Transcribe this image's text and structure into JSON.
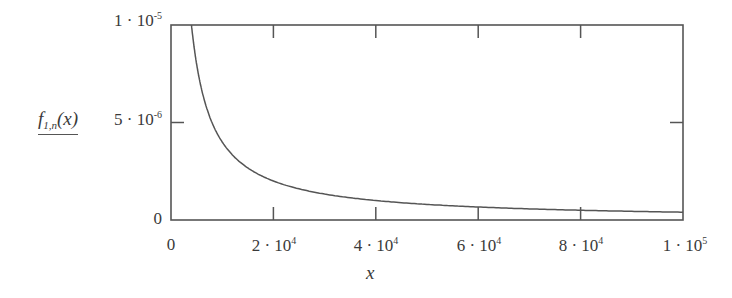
{
  "chart_data": {
    "type": "line",
    "title": "",
    "xlabel": "x",
    "ylabel": "f_{1,n}(x)",
    "xlim": [
      0,
      100000
    ],
    "ylim": [
      0,
      1e-05
    ],
    "grid": false,
    "legend": null,
    "x_ticks": [
      "0",
      "2·10^4",
      "4·10^4",
      "6·10^4",
      "8·10^4",
      "1·10^5"
    ],
    "y_ticks": [
      "0",
      "5·10^-6",
      "1·10^-5"
    ],
    "series": [
      {
        "name": "f_{1,n}(x)",
        "formula_approx": "0.04/x",
        "x": [
          4000,
          5000,
          6000,
          8000,
          10000,
          15000,
          20000,
          30000,
          40000,
          50000,
          60000,
          70000,
          80000,
          90000,
          100000
        ],
        "values": [
          1e-05,
          8e-06,
          6.67e-06,
          5e-06,
          4e-06,
          2.67e-06,
          2e-06,
          1.33e-06,
          1e-06,
          8e-07,
          6.67e-07,
          5.71e-07,
          5e-07,
          4.44e-07,
          4e-07
        ]
      }
    ],
    "line_color": "#555555"
  },
  "labels": {
    "y_title_main": "f",
    "y_title_sub": "1,n",
    "y_title_arg": "(x)",
    "x_title": "x",
    "y_ticks": [
      {
        "mant": "0",
        "exp": ""
      },
      {
        "mant": "5 · 10",
        "exp": "-6"
      },
      {
        "mant": "1 · 10",
        "exp": "-5"
      }
    ],
    "x_ticks": [
      {
        "mant": "0",
        "exp": ""
      },
      {
        "mant": "2 · 10",
        "exp": "4"
      },
      {
        "mant": "4 · 10",
        "exp": "4"
      },
      {
        "mant": "6 · 10",
        "exp": "4"
      },
      {
        "mant": "8 · 10",
        "exp": "4"
      },
      {
        "mant": "1 · 10",
        "exp": "5"
      }
    ]
  }
}
